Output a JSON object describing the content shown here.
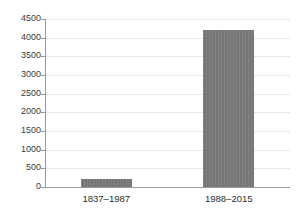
{
  "chart_data": {
    "type": "bar",
    "title": "",
    "subtitle": "",
    "xlabel": "",
    "ylabel": "",
    "categories": [
      "1837–1987",
      "1988–2015"
    ],
    "values": [
      220,
      4200
    ],
    "ylim": [
      0,
      4500
    ],
    "yticks": [
      0,
      500,
      1000,
      1500,
      2000,
      2500,
      3000,
      3500,
      4000,
      4500
    ],
    "ytick_labels": [
      "0",
      "500",
      "1000",
      "1500",
      "2000",
      "2500",
      "3000",
      "3500",
      "4000",
      "4500"
    ],
    "grid": true,
    "grid_axis": "y",
    "legend": false,
    "legend_position": "none",
    "annotations": [],
    "bar_color": "#757575",
    "gridline_color": "#e8e8e8",
    "axis_color": "#9a9a9a",
    "background_color": "#ffffff",
    "tick_label_color": "#3a3a3a",
    "category_label_color": "#2e2e2e"
  }
}
